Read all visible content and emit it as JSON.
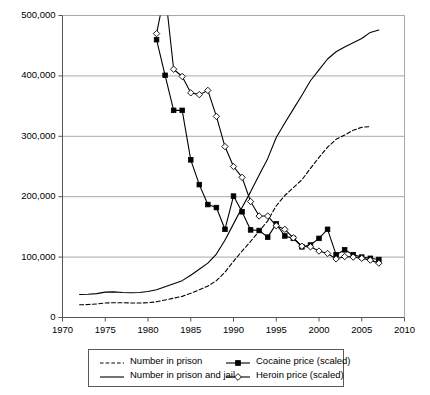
{
  "chart_data": {
    "type": "line",
    "title": "",
    "xlabel": "",
    "ylabel": "",
    "xlim": [
      1970,
      2010
    ],
    "ylim": [
      0,
      500000
    ],
    "grid": "horizontal",
    "legend_position": "bottom",
    "x_ticks": [
      1970,
      1975,
      1980,
      1985,
      1990,
      1995,
      2000,
      2005,
      2010
    ],
    "x_tick_labels": [
      "1970",
      "1975",
      "1980",
      "1985",
      "1990",
      "1995",
      "2000",
      "2005",
      "2010"
    ],
    "y_ticks": [
      0,
      100000,
      200000,
      300000,
      400000,
      500000
    ],
    "y_tick_labels": [
      "0",
      "100,000",
      "200,000",
      "300,000",
      "400,000",
      "500,000"
    ],
    "series": [
      {
        "name": "Number in prison",
        "style": "dashed",
        "marker": "none",
        "color": "#000000",
        "x": [
          1972,
          1973,
          1974,
          1975,
          1976,
          1977,
          1978,
          1979,
          1980,
          1981,
          1982,
          1983,
          1984,
          1985,
          1986,
          1987,
          1988,
          1989,
          1990,
          1991,
          1992,
          1993,
          1994,
          1995,
          1996,
          1997,
          1998,
          1999,
          2000,
          2001,
          2002,
          2003,
          2004,
          2005,
          2006
        ],
        "values": [
          21000,
          21500,
          22500,
          24000,
          24500,
          24500,
          24000,
          24000,
          24500,
          26000,
          29000,
          32000,
          35000,
          40000,
          46000,
          52000,
          61000,
          75000,
          93000,
          110000,
          126000,
          143000,
          160000,
          185000,
          202000,
          215000,
          228000,
          247000,
          265000,
          282000,
          295000,
          302000,
          310000,
          315000,
          316000
        ]
      },
      {
        "name": "Number in prison and jail",
        "style": "solid",
        "marker": "none",
        "color": "#000000",
        "x": [
          1972,
          1973,
          1974,
          1975,
          1976,
          1977,
          1978,
          1979,
          1980,
          1981,
          1982,
          1983,
          1984,
          1985,
          1986,
          1987,
          1988,
          1989,
          1990,
          1991,
          1992,
          1993,
          1994,
          1995,
          1996,
          1997,
          1998,
          1999,
          2000,
          2001,
          2002,
          2003,
          2004,
          2005,
          2006,
          2007
        ],
        "values": [
          38000,
          38500,
          39500,
          42000,
          42500,
          41500,
          41000,
          41500,
          43000,
          46000,
          51000,
          56000,
          61000,
          70000,
          80000,
          90000,
          105000,
          128000,
          155000,
          182000,
          208000,
          236000,
          263000,
          298000,
          322000,
          345000,
          368000,
          392000,
          410000,
          428000,
          440000,
          448000,
          455000,
          462000,
          472000,
          476000
        ]
      },
      {
        "name": "Cocaine price (scaled)",
        "style": "solid",
        "marker": "filled-square",
        "color": "#000000",
        "x": [
          1981,
          1982,
          1983,
          1984,
          1985,
          1986,
          1987,
          1988,
          1989,
          1990,
          1991,
          1992,
          1993,
          1994,
          1995,
          1996,
          1997,
          1998,
          1999,
          2000,
          2001,
          2002,
          2003,
          2004,
          2005,
          2006,
          2007
        ],
        "values": [
          460000,
          401000,
          343000,
          343000,
          261000,
          220000,
          187000,
          182000,
          146000,
          201000,
          175000,
          145000,
          144000,
          133000,
          155000,
          135000,
          131000,
          117000,
          120000,
          131000,
          146000,
          104000,
          112000,
          104000,
          100000,
          98000,
          96000
        ]
      },
      {
        "name": "Heroin price (scaled)",
        "style": "solid",
        "marker": "open-diamond",
        "color": "#000000",
        "x": [
          1981,
          1982,
          1983,
          1984,
          1985,
          1986,
          1987,
          1988,
          1989,
          1990,
          1991,
          1992,
          1993,
          1994,
          1995,
          1996,
          1997,
          1998,
          1999,
          2000,
          2001,
          2002,
          2003,
          2004,
          2005,
          2006,
          2007
        ],
        "values": [
          470000,
          540000,
          411000,
          399000,
          372000,
          369000,
          376000,
          333000,
          283000,
          250000,
          232000,
          192000,
          168000,
          168000,
          152000,
          146000,
          132000,
          118000,
          117000,
          110000,
          106000,
          97000,
          101000,
          100000,
          98000,
          95000,
          90000
        ]
      }
    ]
  },
  "legend": {
    "items": [
      {
        "label": "Number in prison",
        "key": "dashed-line"
      },
      {
        "label": "Number in prison and jail",
        "key": "solid-line"
      },
      {
        "label": "Cocaine price (scaled)",
        "key": "filled-square-line"
      },
      {
        "label": "Heroin price (scaled)",
        "key": "open-diamond-line"
      }
    ]
  }
}
